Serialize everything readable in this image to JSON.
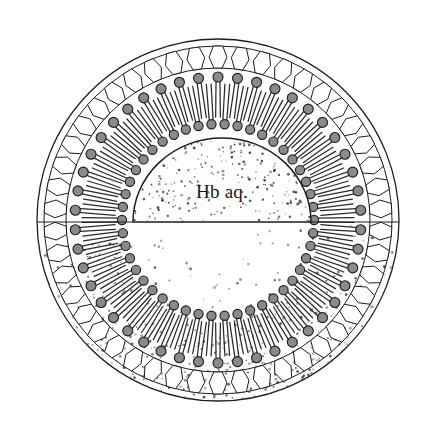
{
  "figure": {
    "cavity_label": "Hb aq.",
    "caption_partial": "",
    "colors": {
      "background": "#ffffff",
      "outline": "#1c1c1c",
      "lipid_head_fill": "#8a8a8a",
      "lipid_head_stroke": "#1f1f1f",
      "lipid_tail": "#2a2a2a",
      "stipple": "#2e2e2e",
      "shell_cell_fill": "#ffffff"
    }
  },
  "geometry": {
    "canvas": {
      "width": 422,
      "height": 433
    },
    "outer_sphere": {
      "cx": 218,
      "cy": 220,
      "r": 181
    },
    "equator_y": 222,
    "shell_ring": {
      "r_outer": 174,
      "r_inner": 152,
      "cell_count": 46
    },
    "outer_leaflet": {
      "head_r": 143,
      "head_radius": 5.0,
      "tail_length": 40,
      "count": 46
    },
    "inner_leaflet": {
      "head_r": 96,
      "head_radius": 4.6,
      "tail_length": 40,
      "count": 46
    },
    "cavity": {
      "cx": 222,
      "cy": 222,
      "rx": 89,
      "ry": 84
    }
  },
  "layers": [
    {
      "name": "outer-sphere-boundary",
      "kind": "circle"
    },
    {
      "name": "hexagonal-shell-ring",
      "kind": "ring-of-cells"
    },
    {
      "name": "outer-lipid-leaflet",
      "kind": "lipid-ring"
    },
    {
      "name": "inner-lipid-leaflet",
      "kind": "lipid-ring"
    },
    {
      "name": "aqueous-core",
      "kind": "dome"
    },
    {
      "name": "lower-hemisphere-stipple",
      "kind": "stipple"
    }
  ],
  "chart_data": {
    "type": "diagram",
    "components": [
      {
        "label": "Hb aq.",
        "description": "aqueous hemoglobin core",
        "region": "center dome"
      },
      {
        "label": "",
        "description": "inner phospholipid leaflet, polar heads facing core",
        "region": "inner ring"
      },
      {
        "label": "",
        "description": "outer phospholipid leaflet, polar heads facing shell",
        "region": "outer ring"
      },
      {
        "label": "",
        "description": "outer hexagonal shell cells",
        "region": "outermost ring"
      },
      {
        "label": "",
        "description": "stippled lower hemisphere (cut-away)",
        "region": "bottom half"
      }
    ]
  }
}
